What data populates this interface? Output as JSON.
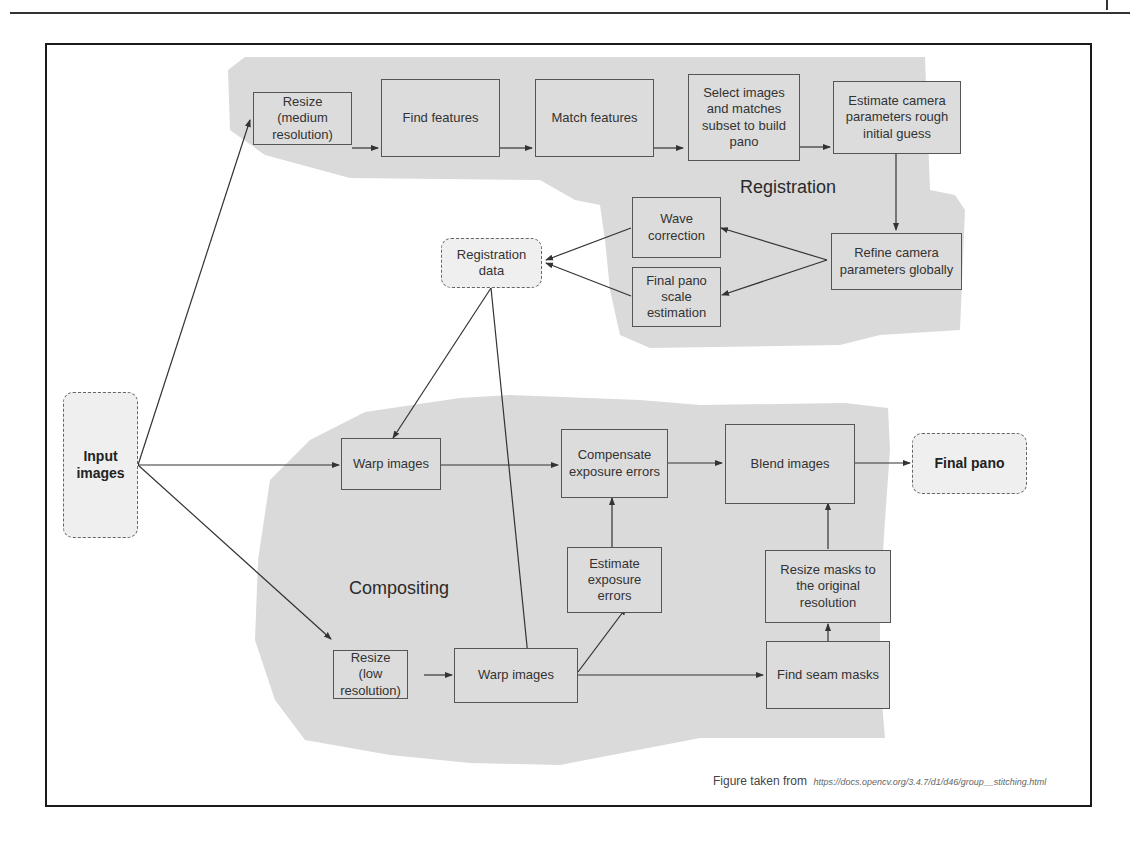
{
  "figure": {
    "regions": {
      "registration": "Registration",
      "compositing": "Compositing"
    },
    "nodes": {
      "input_images": "Input images",
      "resize_medium": "Resize (medium resolution)",
      "find_features": "Find features",
      "match_features": "Match features",
      "select_images": "Select images and matches subset to build pano",
      "estimate_camera": "Estimate camera parameters rough initial guess",
      "refine_camera": "Refine camera parameters globally",
      "wave_correction": "Wave correction",
      "final_pano_scale": "Final pano scale estimation",
      "registration_data": "Registration data",
      "warp_images_top": "Warp images",
      "compensate_exposure": "Compensate exposure errors",
      "blend_images": "Blend images",
      "final_pano": "Final pano",
      "estimate_exposure": "Estimate exposure errors",
      "resize_masks": "Resize masks to the original resolution",
      "resize_low": "Resize (low resolution)",
      "warp_images_bottom": "Warp images",
      "find_seam_masks": "Find seam masks"
    },
    "caption": {
      "prefix": "Figure taken from",
      "url": "https://docs.opencv.org/3.4.7/d1/d46/group__stitching.html"
    },
    "colors": {
      "region_fill": "#dadada",
      "box_fill": "#dcdcdc",
      "terminal_fill": "#efefef",
      "line": "#333333"
    }
  }
}
